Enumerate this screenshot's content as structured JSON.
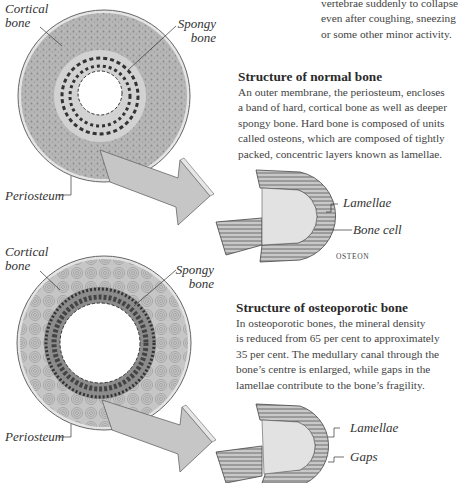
{
  "intro_fragment": {
    "lines": [
      "vertebrae suddenly to collapse",
      "even after coughing, sneezing",
      "or some other minor activity."
    ]
  },
  "normal_section": {
    "heading": "Structure of normal bone",
    "body_lines": [
      "An outer membrane, the periosteum, encloses",
      "a band of hard, cortical bone as well as deeper",
      "spongy bone. Hard bone is composed of units",
      "called osteons, which are composed of tightly",
      "packed, concentric layers known as lamellae."
    ],
    "cross_section_labels": {
      "cortical_line1": "Cortical",
      "cortical_line2": "bone",
      "spongy_line1": "Spongy",
      "spongy_line2": "bone",
      "periosteum": "Periosteum"
    },
    "osteon_labels": {
      "lamellae": "Lamellae",
      "bone_cell": "Bone cell",
      "caption": "OSTEON"
    }
  },
  "osteoporotic_section": {
    "heading": "Structure of osteoporotic bone",
    "body_lines": [
      "In osteoporotic bones, the mineral density",
      "is reduced from 65 per cent to approximately",
      "35 per cent. The medullary canal through the",
      "bone’s centre is enlarged, while gaps in the",
      "lamellae contribute to the bone’s fragility."
    ],
    "cross_section_labels": {
      "cortical_line1": "Cortical",
      "cortical_line2": "bone",
      "spongy_line1": "Spongy",
      "spongy_line2": "bone",
      "periosteum": "Periosteum"
    },
    "osteon_labels": {
      "lamellae": "Lamellae",
      "gaps": "Gaps"
    }
  },
  "colors": {
    "cortical_fill": "#b9b9b9",
    "periosteum_ring": "#d8d8d8",
    "spongy_band": "#d0d0d0",
    "arrow_fill": "#c4c4c4",
    "text": "#444444"
  }
}
